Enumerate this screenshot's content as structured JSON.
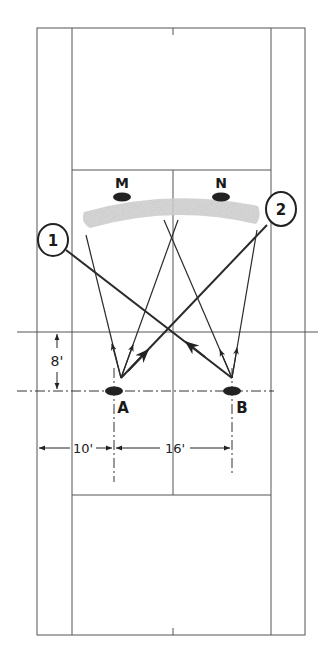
{
  "diagram": {
    "players": {
      "M": {
        "label": "M"
      },
      "N": {
        "label": "N"
      },
      "A": {
        "label": "A"
      },
      "B": {
        "label": "B"
      }
    },
    "callouts": [
      {
        "label": "1"
      },
      {
        "label": "2"
      }
    ],
    "dimensions": {
      "depth": "8'",
      "side_offset": "10'",
      "player_spacing": "16'"
    },
    "colors": {
      "line": "#555555",
      "ink": "#222222",
      "shade": "#d0d0d0"
    }
  }
}
